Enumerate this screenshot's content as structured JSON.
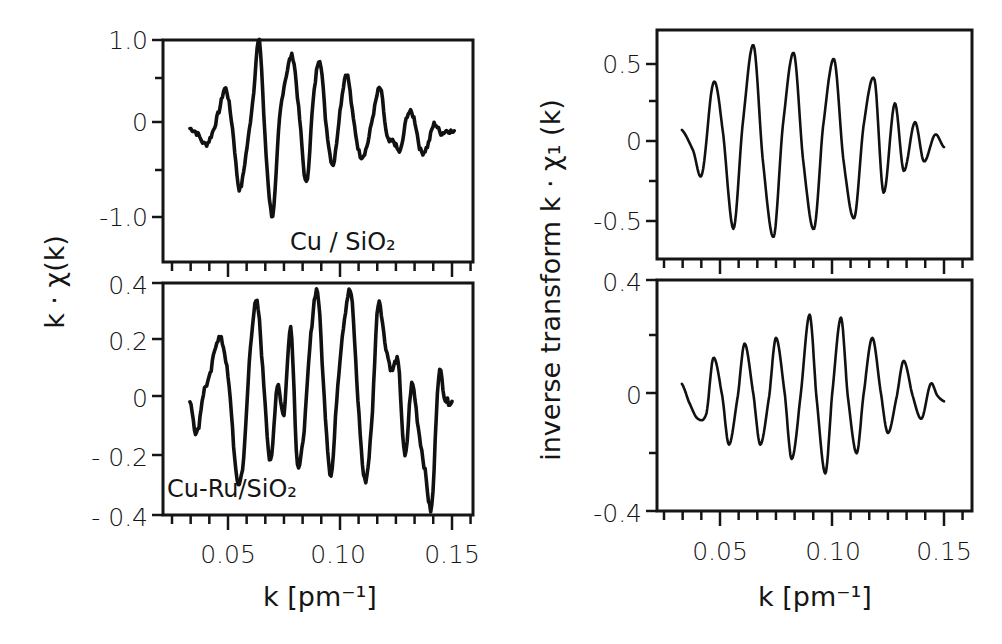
{
  "figure": {
    "left_ylabel": "k · χ(k)",
    "right_ylabel": "inverse transform  k · χ₁ (k)",
    "xlabel": "k [pm⁻¹]",
    "panels": {
      "top_left": {
        "annotation": "Cu / SiO₂",
        "yticks": [
          "1.0",
          "0",
          "-1.0"
        ]
      },
      "bottom_left": {
        "annotation": "Cu-Ru/SiO₂",
        "yticks": [
          "0.4",
          "0.2",
          "0",
          "- 0.2",
          "- 0.4"
        ]
      },
      "top_right": {
        "yticks": [
          "0.5",
          "0",
          "-0.5"
        ]
      },
      "bottom_right": {
        "yticks": [
          "0.4",
          "0",
          "-0.4"
        ]
      }
    },
    "xticks": [
      "0.05",
      "0.10",
      "0.15"
    ]
  },
  "chart_data": [
    {
      "id": "top_left",
      "type": "line",
      "title": "Cu / SiO2",
      "xlabel": "k [pm^-1]",
      "ylabel": "k · χ(k)",
      "xlim": [
        0.022,
        0.163
      ],
      "ylim": [
        -1.45,
        1.0
      ],
      "yticks": [
        1.0,
        0,
        -1.0
      ],
      "xticks": [
        0.05,
        0.1,
        0.15
      ],
      "grid": false,
      "x": [
        0.033,
        0.036,
        0.04,
        0.043,
        0.046,
        0.049,
        0.052,
        0.055,
        0.058,
        0.061,
        0.064,
        0.067,
        0.07,
        0.073,
        0.076,
        0.079,
        0.082,
        0.085,
        0.088,
        0.091,
        0.094,
        0.097,
        0.1,
        0.103,
        0.106,
        0.109,
        0.112,
        0.115,
        0.118,
        0.121,
        0.124,
        0.127,
        0.13,
        0.133,
        0.136,
        0.139,
        0.142,
        0.145,
        0.148,
        0.151
      ],
      "values": [
        0.0,
        -0.05,
        -0.18,
        -0.05,
        0.2,
        0.45,
        0.0,
        -0.68,
        -0.3,
        0.3,
        0.98,
        -0.3,
        -0.98,
        0.1,
        0.6,
        0.8,
        0.1,
        -0.62,
        0.3,
        0.78,
        0.0,
        -0.4,
        0.2,
        0.62,
        0.1,
        -0.3,
        -0.2,
        0.18,
        0.45,
        -0.1,
        -0.15,
        -0.25,
        0.15,
        0.12,
        -0.25,
        -0.2,
        0.05,
        -0.05,
        -0.02,
        -0.05
      ]
    },
    {
      "id": "bottom_left",
      "type": "line",
      "title": "Cu-Ru/SiO2",
      "xlabel": "k [pm^-1]",
      "ylabel": "k · χ(k)",
      "xlim": [
        0.022,
        0.163
      ],
      "ylim": [
        -0.4,
        0.4
      ],
      "yticks": [
        0.4,
        0.2,
        0,
        -0.2,
        -0.4
      ],
      "xticks": [
        0.05,
        0.1,
        0.15
      ],
      "grid": false,
      "x": [
        0.033,
        0.036,
        0.039,
        0.042,
        0.045,
        0.048,
        0.051,
        0.054,
        0.057,
        0.06,
        0.063,
        0.066,
        0.069,
        0.072,
        0.075,
        0.078,
        0.081,
        0.084,
        0.087,
        0.09,
        0.093,
        0.096,
        0.099,
        0.102,
        0.105,
        0.108,
        0.111,
        0.114,
        0.117,
        0.12,
        0.123,
        0.126,
        0.129,
        0.132,
        0.135,
        0.138,
        0.141,
        0.144,
        0.147,
        0.15
      ],
      "values": [
        0.0,
        -0.12,
        0.02,
        0.08,
        0.2,
        0.18,
        0.0,
        -0.28,
        -0.2,
        0.18,
        0.33,
        0.05,
        -0.22,
        0.05,
        -0.05,
        0.25,
        -0.22,
        -0.1,
        0.22,
        0.37,
        0.0,
        -0.26,
        0.05,
        0.28,
        0.36,
        0.0,
        -0.28,
        -0.1,
        0.33,
        0.2,
        0.1,
        0.12,
        -0.2,
        0.05,
        -0.1,
        -0.25,
        -0.37,
        0.08,
        0.0,
        -0.01
      ]
    },
    {
      "id": "top_right",
      "type": "line",
      "title": "inverse transform (Cu/SiO2)",
      "xlabel": "k [pm^-1]",
      "ylabel": "k · χ1(k)",
      "xlim": [
        0.022,
        0.163
      ],
      "ylim": [
        -0.72,
        0.72
      ],
      "yticks": [
        0.5,
        0,
        -0.5
      ],
      "xticks": [
        0.05,
        0.1,
        0.15
      ],
      "grid": false,
      "x": [
        0.033,
        0.038,
        0.042,
        0.047,
        0.051,
        0.056,
        0.06,
        0.065,
        0.069,
        0.074,
        0.078,
        0.083,
        0.087,
        0.092,
        0.096,
        0.101,
        0.105,
        0.11,
        0.114,
        0.119,
        0.123,
        0.128,
        0.132,
        0.137,
        0.141,
        0.146,
        0.15
      ],
      "values": [
        0.08,
        -0.05,
        -0.2,
        0.38,
        0.1,
        -0.55,
        0.1,
        0.62,
        -0.1,
        -0.6,
        0.1,
        0.57,
        -0.1,
        -0.55,
        0.1,
        0.53,
        -0.1,
        -0.48,
        0.1,
        0.4,
        -0.32,
        0.25,
        -0.18,
        0.13,
        -0.12,
        0.05,
        -0.03
      ]
    },
    {
      "id": "bottom_right",
      "type": "line",
      "title": "inverse transform (Cu-Ru/SiO2)",
      "xlabel": "k [pm^-1]",
      "ylabel": "k · χ1(k)",
      "xlim": [
        0.022,
        0.163
      ],
      "ylim": [
        -0.4,
        0.4
      ],
      "yticks": [
        0.4,
        0,
        -0.4
      ],
      "xticks": [
        0.05,
        0.1,
        0.15
      ],
      "grid": false,
      "x": [
        0.033,
        0.036,
        0.04,
        0.044,
        0.047,
        0.051,
        0.054,
        0.058,
        0.061,
        0.065,
        0.068,
        0.072,
        0.075,
        0.079,
        0.082,
        0.086,
        0.09,
        0.093,
        0.097,
        0.1,
        0.104,
        0.107,
        0.111,
        0.114,
        0.118,
        0.122,
        0.125,
        0.129,
        0.132,
        0.136,
        0.14,
        0.144,
        0.147,
        0.15
      ],
      "values": [
        0.04,
        -0.02,
        -0.08,
        -0.06,
        0.13,
        0.0,
        -0.17,
        0.0,
        0.18,
        0.0,
        -0.17,
        0.0,
        0.2,
        0.0,
        -0.22,
        0.0,
        0.28,
        0.0,
        -0.27,
        0.0,
        0.27,
        0.0,
        -0.2,
        0.0,
        0.2,
        0.0,
        -0.13,
        0.0,
        0.12,
        0.0,
        -0.08,
        0.04,
        0.0,
        -0.02
      ]
    }
  ]
}
